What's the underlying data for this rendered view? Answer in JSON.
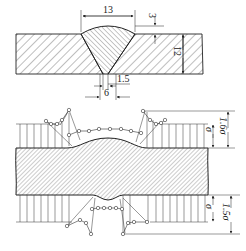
{
  "figure": {
    "upper": {
      "title": "butt weld cross-section with dimensions",
      "dimensions": {
        "bead_width": "13",
        "reinforcement_height": "3",
        "plate_thickness": "12",
        "root_gap": "1.5",
        "root_width": "6"
      }
    },
    "lower": {
      "title": "stress distribution across weld",
      "labels": {
        "top_nominal": "σ",
        "top_peak": "1.6σ",
        "bottom_nominal": "σ",
        "bottom_peak": "1.5σ"
      },
      "peak_factor_top": 1.6,
      "peak_factor_bottom": 1.5
    },
    "colors": {
      "line": "#222222",
      "hatch": "#444444",
      "background": "#ffffff"
    }
  }
}
